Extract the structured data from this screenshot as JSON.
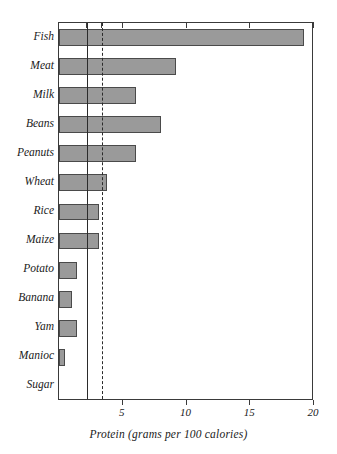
{
  "chart_data": {
    "type": "bar",
    "orientation": "horizontal",
    "title": "",
    "xlabel": "Protein (grams per 100 calories)",
    "ylabel": "",
    "xlim": [
      0,
      20
    ],
    "grid": false,
    "legend": null,
    "categories": [
      "Fish",
      "Meat",
      "Milk",
      "Beans",
      "Peanuts",
      "Wheat",
      "Rice",
      "Maize",
      "Potato",
      "Banana",
      "Yam",
      "Manioc",
      "Sugar"
    ],
    "values": [
      19.2,
      9.2,
      6.0,
      8.0,
      6.0,
      3.8,
      3.1,
      3.1,
      1.4,
      1.0,
      1.4,
      0.5,
      0.0
    ],
    "xticks": [
      5,
      10,
      15,
      20
    ],
    "xtick_labels": [
      "5",
      "10",
      "15",
      "20"
    ],
    "annotations": [
      {
        "kind": "reference-line",
        "style": "solid",
        "value": 2.2
      },
      {
        "kind": "reference-line",
        "style": "dashed",
        "value": 3.4
      }
    ],
    "bar_color": "#9a9a9a",
    "bar_edge_color": "#4a4a4a",
    "axis_color": "#3a3a3a"
  },
  "caption": {
    "text": "Protein (grams per 100 calories)"
  }
}
